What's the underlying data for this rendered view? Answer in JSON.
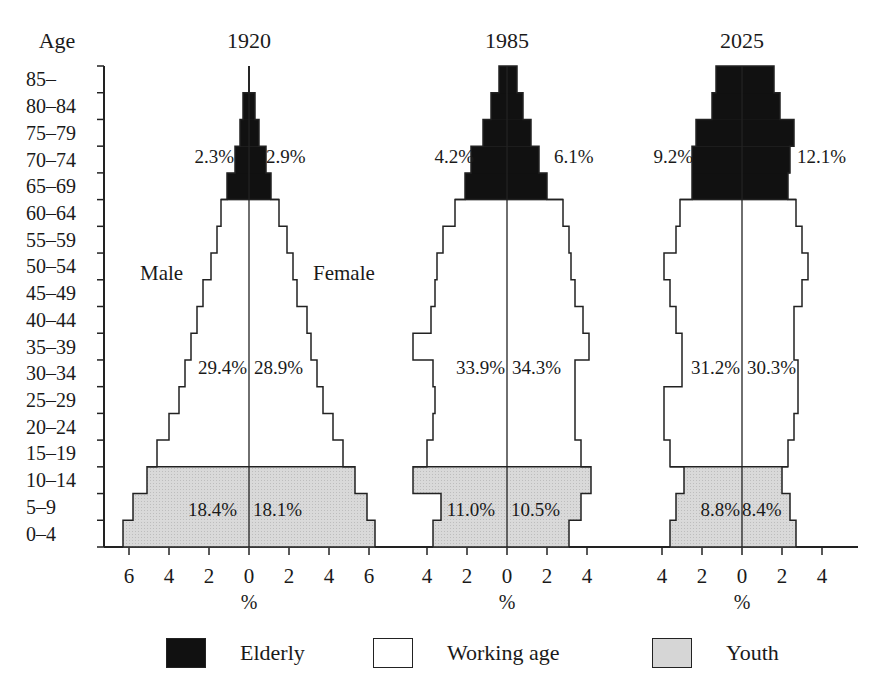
{
  "chart_data": {
    "type": "bar",
    "subtype": "population-pyramid",
    "ylabel": "Age",
    "xlabel": "%",
    "age_groups": [
      "0–4",
      "5–9",
      "10–14",
      "15–19",
      "20–24",
      "25–29",
      "30–34",
      "35–39",
      "40–44",
      "45–49",
      "50–54",
      "55–59",
      "60–64",
      "65–69",
      "70–74",
      "75–79",
      "80–84",
      "85–"
    ],
    "category_of_age_group": [
      "Youth",
      "Youth",
      "Youth",
      "Working age",
      "Working age",
      "Working age",
      "Working age",
      "Working age",
      "Working age",
      "Working age",
      "Working age",
      "Working age",
      "Working age",
      "Elderly",
      "Elderly",
      "Elderly",
      "Elderly",
      "Elderly"
    ],
    "sex_labels": {
      "left": "Male",
      "right": "Female"
    },
    "panels": [
      {
        "year": "1920",
        "xlim": [
          -6,
          6
        ],
        "ticks": [
          "6",
          "4",
          "2",
          "0",
          "2",
          "4",
          "6"
        ],
        "tick_values": [
          -6,
          -4,
          -2,
          0,
          2,
          4,
          6
        ],
        "male": [
          6.3,
          5.8,
          5.1,
          4.6,
          4.0,
          3.5,
          3.2,
          2.9,
          2.6,
          2.3,
          1.9,
          1.6,
          1.4,
          1.1,
          0.7,
          0.45,
          0.3,
          0.0
        ],
        "female": [
          6.3,
          5.9,
          5.3,
          4.7,
          4.2,
          3.7,
          3.4,
          3.1,
          2.9,
          2.4,
          2.2,
          1.9,
          1.5,
          1.1,
          0.85,
          0.5,
          0.3,
          0.0
        ],
        "annotations": {
          "elderly_male": "2.3%",
          "elderly_female": "2.9%",
          "working_male": "29.4%",
          "working_female": "28.9%",
          "youth_male": "18.4%",
          "youth_female": "18.1%"
        }
      },
      {
        "year": "1985",
        "xlim": [
          -4,
          4
        ],
        "ticks": [
          "4",
          "2",
          "0",
          "2",
          "4"
        ],
        "tick_values": [
          -4,
          -2,
          0,
          2,
          4
        ],
        "male": [
          3.7,
          3.3,
          4.7,
          4.0,
          3.7,
          3.6,
          3.7,
          4.7,
          3.8,
          3.6,
          3.5,
          3.2,
          2.6,
          2.1,
          1.8,
          1.2,
          0.8,
          0.4
        ],
        "female": [
          3.1,
          3.7,
          4.2,
          3.7,
          3.4,
          3.4,
          3.4,
          4.1,
          3.8,
          3.4,
          3.2,
          3.1,
          2.8,
          2.0,
          1.6,
          1.2,
          0.8,
          0.5
        ],
        "annotations": {
          "elderly_male": "4.2%",
          "elderly_female": "6.1%",
          "working_male": "33.9%",
          "working_female": "34.3%",
          "youth_male": "11.0%",
          "youth_female": "10.5%"
        }
      },
      {
        "year": "2025",
        "xlim": [
          -4,
          4
        ],
        "ticks": [
          "4",
          "2",
          "0",
          "2",
          "4"
        ],
        "tick_values": [
          -4,
          -2,
          0,
          2,
          4
        ],
        "male": [
          3.6,
          3.3,
          2.9,
          3.6,
          3.9,
          3.9,
          3.0,
          3.0,
          3.3,
          3.6,
          3.9,
          3.3,
          3.1,
          2.5,
          2.5,
          2.3,
          1.5,
          1.3
        ],
        "female": [
          2.7,
          2.4,
          2.0,
          2.3,
          2.6,
          2.8,
          2.8,
          2.6,
          2.6,
          3.0,
          3.3,
          3.0,
          2.7,
          2.3,
          2.4,
          2.6,
          1.9,
          1.6
        ],
        "annotations": {
          "elderly_male": "9.2%",
          "elderly_female": "12.1%",
          "working_male": "31.2%",
          "working_female": "30.3%",
          "youth_male": "8.8%",
          "youth_female": "8.4%"
        }
      }
    ],
    "legend": [
      {
        "label": "Elderly",
        "color": "#111111"
      },
      {
        "label": "Working age",
        "color": "#ffffff"
      },
      {
        "label": "Youth",
        "color": "#d6d6d6"
      }
    ],
    "legend_position": "bottom",
    "grid": false
  },
  "legend": {
    "elderly": "Elderly",
    "working": "Working age",
    "youth": "Youth"
  },
  "colors": {
    "elderly": "#111111",
    "working": "#ffffff",
    "youth": "#d6d6d6",
    "line": "#222222"
  }
}
